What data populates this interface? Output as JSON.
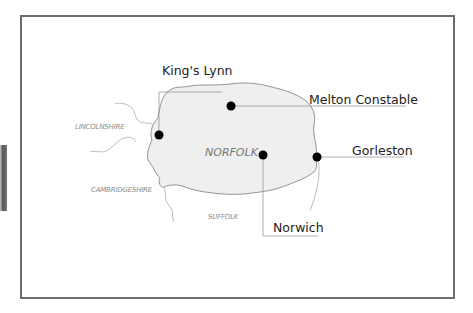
{
  "map": {
    "region": "NORFOLK",
    "colors": {
      "region_fill": "#efefef",
      "border": "#7a7a7a",
      "leader": "#999999",
      "marker": "#000000",
      "frame": "#6d6d6d"
    },
    "neighbouring_counties": [
      {
        "name": "LINCOLNSHIRE"
      },
      {
        "name": "CAMBRIDGESHIRE"
      },
      {
        "name": "SUFFOLK"
      }
    ],
    "towns": [
      {
        "name": "King's Lynn"
      },
      {
        "name": "Melton Constable"
      },
      {
        "name": "Gorleston"
      },
      {
        "name": "Norwich"
      }
    ]
  }
}
